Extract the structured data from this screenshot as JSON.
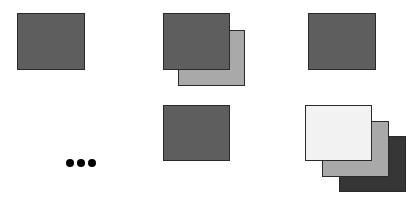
{
  "diagram": {
    "colors": {
      "dark_gray": "#5e5e5e",
      "medium_gray": "#a9a9a9",
      "light": "#f2f2f2",
      "darkest": "#363636",
      "border": "#2a2a2a",
      "dot": "#000000"
    },
    "cells": [
      {
        "id": "top-left",
        "layers": [
          {
            "x": 17,
            "y": 13,
            "w": 68,
            "h": 57,
            "fill": "#5e5e5e"
          }
        ]
      },
      {
        "id": "top-middle",
        "layers": [
          {
            "x": 178,
            "y": 30,
            "w": 67,
            "h": 56,
            "fill": "#a9a9a9"
          },
          {
            "x": 163,
            "y": 13,
            "w": 67,
            "h": 57,
            "fill": "#5e5e5e"
          }
        ]
      },
      {
        "id": "top-right",
        "layers": [
          {
            "x": 308,
            "y": 13,
            "w": 68,
            "h": 57,
            "fill": "#5e5e5e"
          }
        ]
      },
      {
        "id": "bottom-left",
        "ellipsis": "..."
      },
      {
        "id": "bottom-middle",
        "layers": [
          {
            "x": 163,
            "y": 105,
            "w": 67,
            "h": 56,
            "fill": "#5e5e5e"
          }
        ]
      },
      {
        "id": "bottom-right",
        "layers": [
          {
            "x": 339,
            "y": 136,
            "w": 67,
            "h": 56,
            "fill": "#363636"
          },
          {
            "x": 322,
            "y": 121,
            "w": 67,
            "h": 56,
            "fill": "#a9a9a9"
          },
          {
            "x": 305,
            "y": 105,
            "w": 67,
            "h": 56,
            "fill": "#f2f2f2"
          }
        ]
      }
    ],
    "ellipsis": {
      "label": "...",
      "count": 3,
      "x": 66,
      "y": 159
    }
  }
}
